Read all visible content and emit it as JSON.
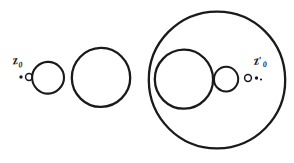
{
  "figure": {
    "kind": "hand-drawn-geometric-diagram",
    "width": 294,
    "height": 163,
    "background_color": "#ffffff",
    "ink_color": "#1a1a1a",
    "labels": {
      "left_point": {
        "base": "z",
        "subscript": "0",
        "prime": "",
        "full": "z0"
      },
      "right_point": {
        "base": "z",
        "subscript": "0",
        "prime": "′",
        "full": "z′0"
      }
    },
    "shapes": {
      "left_group": {
        "marker_dot": {
          "cx": 21,
          "cy": 77,
          "r": 1.6,
          "filled": true
        },
        "marker_ring": {
          "cx": 29,
          "cy": 77,
          "r": 3.6,
          "filled": false
        },
        "circle_small": {
          "cx": 48,
          "cy": 78,
          "r": 16
        },
        "circle_medium": {
          "cx": 101,
          "cy": 77,
          "r": 29
        }
      },
      "right_group": {
        "circle_large": {
          "cx": 217,
          "cy": 80,
          "r": 68
        },
        "circle_inner_medium": {
          "cx": 184,
          "cy": 79,
          "r": 29
        },
        "circle_inner_small": {
          "cx": 226,
          "cy": 79,
          "r": 12
        },
        "marker_ring": {
          "cx": 248,
          "cy": 78,
          "r": 3.6,
          "filled": false
        },
        "marker_dot": {
          "cx": 256,
          "cy": 78,
          "r": 1.6,
          "filled": true
        }
      }
    }
  }
}
